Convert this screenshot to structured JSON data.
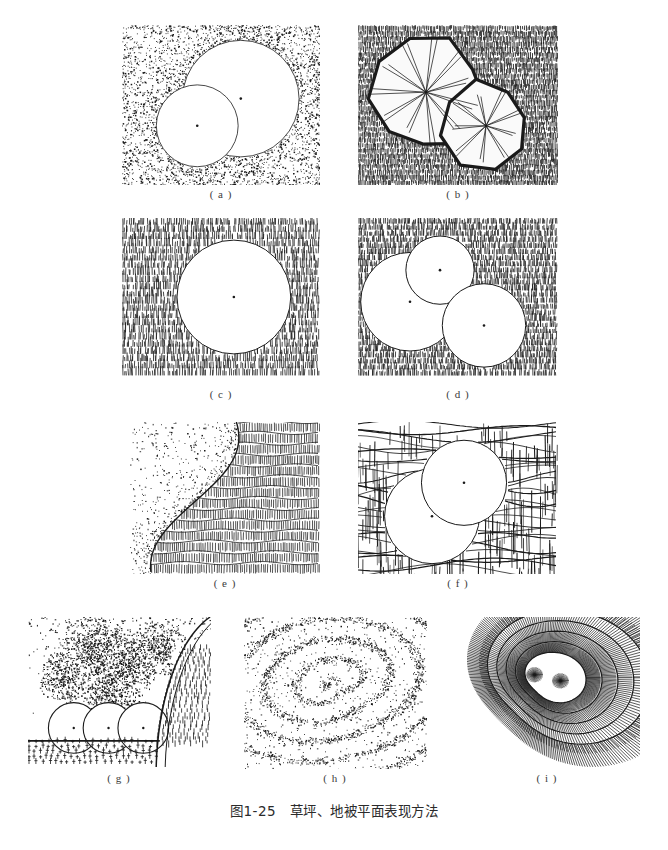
{
  "figure": {
    "caption": "图1-25　草坪、地被平面表现方法",
    "caption_number": "图1-25",
    "caption_title": "草坪、地被平面表现方法",
    "background_color": "#ffffff",
    "ink_color": "#1a1a1a"
  },
  "panels": [
    {
      "id": "a",
      "label": "( a )",
      "technique": "stipple-dots-with-tree-circles",
      "description": "点绘（点画法）表现草坪，两个相交白色圆形树冠",
      "x": 122,
      "y": 25,
      "w": 198,
      "h": 160,
      "texture": "stipple",
      "density": 0.55,
      "circles": [
        {
          "cx": 0.6,
          "cy": 0.46,
          "r": 0.235,
          "center_dot": true
        },
        {
          "cx": 0.38,
          "cy": 0.63,
          "r": 0.165,
          "center_dot": true
        }
      ]
    },
    {
      "id": "b",
      "label": "( b )",
      "technique": "dense-vertical-strokes-with-polygon-canopies",
      "description": "密集竖向短线表现草坪，两个多边形树冠带放射枝线",
      "x": 358,
      "y": 25,
      "w": 200,
      "h": 160,
      "texture": "vertical-strokes-dense",
      "canopies": [
        {
          "cx": 0.34,
          "cy": 0.42,
          "r": 0.22,
          "sides": 9,
          "rays": 11
        },
        {
          "cx": 0.64,
          "cy": 0.63,
          "r": 0.155,
          "sides": 8,
          "rays": 9
        }
      ]
    },
    {
      "id": "c",
      "label": "( c )",
      "technique": "horizontal-rows-of-grass-tufts",
      "description": "横向排列短草丛笔触，单个白色圆形树冠",
      "x": 122,
      "y": 218,
      "w": 198,
      "h": 158,
      "texture": "grass-rows",
      "rows": 22,
      "circles": [
        {
          "cx": 0.565,
          "cy": 0.5,
          "r": 0.225,
          "center_dot": true
        }
      ]
    },
    {
      "id": "d",
      "label": "( d )",
      "technique": "fine-grass-rows-with-three-circles",
      "description": "细密横排草丛笔触，三个相交白色圆形树冠",
      "x": 358,
      "y": 218,
      "w": 200,
      "h": 158,
      "texture": "grass-rows-fine",
      "rows": 26,
      "circles": [
        {
          "cx": 0.26,
          "cy": 0.53,
          "r": 0.195,
          "center_dot": true
        },
        {
          "cx": 0.41,
          "cy": 0.33,
          "r": 0.135,
          "center_dot": true
        },
        {
          "cx": 0.63,
          "cy": 0.68,
          "r": 0.165,
          "center_dot": true
        }
      ]
    },
    {
      "id": "e",
      "label": "( e )",
      "technique": "stipple-edge-meets-woven-grid",
      "description": "左侧点绘与右侧编织网格草皮，曲线分界",
      "x": 130,
      "y": 422,
      "w": 190,
      "h": 152,
      "texture": "stipple-and-weave",
      "boundary": "curved-vertical"
    },
    {
      "id": "f",
      "label": "( f )",
      "technique": "crosshatch-weave-with-two-circles",
      "description": "交叉网织纹理配流动横线，两个相交白色圆形树冠",
      "x": 358,
      "y": 422,
      "w": 200,
      "h": 152,
      "texture": "crosshatch-flow",
      "circles": [
        {
          "cx": 0.37,
          "cy": 0.62,
          "r": 0.195,
          "center_dot": true
        },
        {
          "cx": 0.53,
          "cy": 0.4,
          "r": 0.175,
          "center_dot": true
        }
      ]
    },
    {
      "id": "g",
      "label": "( g )",
      "technique": "shrub-mass-stipple-with-hatched-lawn",
      "description": "点绘灌木团块、三个圆形植株与短线草地及园路",
      "x": 28,
      "y": 617,
      "w": 183,
      "h": 152,
      "texture": "mass-stipple-plus-hatch",
      "circles": [
        {
          "cx": 0.25,
          "cy": 0.73,
          "r": 0.115,
          "center_dot": true
        },
        {
          "cx": 0.44,
          "cy": 0.73,
          "r": 0.115,
          "center_dot": true
        },
        {
          "cx": 0.63,
          "cy": 0.73,
          "r": 0.115,
          "center_dot": true
        }
      ]
    },
    {
      "id": "h",
      "label": "( h )",
      "technique": "stipple-contour-bands",
      "description": "点绘浓淡表现等高线状地形起伏",
      "x": 244,
      "y": 617,
      "w": 183,
      "h": 152,
      "texture": "stipple-contours",
      "bands": 4
    },
    {
      "id": "i",
      "label": "( i )",
      "technique": "contour-lines-with-hachures",
      "description": "等高线配放射状短线（晕滃线）表现坡地",
      "x": 455,
      "y": 617,
      "w": 185,
      "h": 152,
      "texture": "contour-hachure",
      "contours": 5
    }
  ],
  "labels": {
    "a": {
      "text": "( a )",
      "x": 221,
      "y": 188
    },
    "b": {
      "text": "( b )",
      "x": 458,
      "y": 188
    },
    "c": {
      "text": "( c )",
      "x": 221,
      "y": 388
    },
    "d": {
      "text": "( d )",
      "x": 458,
      "y": 388
    },
    "e": {
      "text": "( e )",
      "x": 225,
      "y": 577
    },
    "f": {
      "text": "( f )",
      "x": 458,
      "y": 577
    },
    "g": {
      "text": "( g )",
      "x": 119,
      "y": 772
    },
    "h": {
      "text": "( h )",
      "x": 335,
      "y": 772
    },
    "i": {
      "text": "( i )",
      "x": 547,
      "y": 772
    }
  }
}
